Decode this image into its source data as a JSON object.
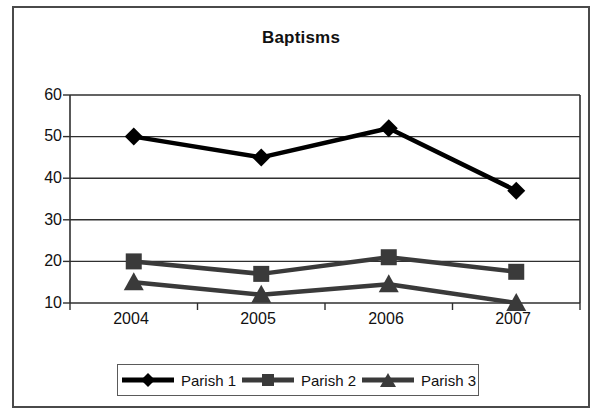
{
  "chart": {
    "title": "Baptisms",
    "legend_position": "bottom"
  },
  "chart_data": {
    "type": "line",
    "title": "Baptisms",
    "xlabel": "",
    "ylabel": "",
    "categories": [
      "2004",
      "2005",
      "2006",
      "2007"
    ],
    "x_tick_labels": [
      "2004",
      "2005",
      "2006",
      "2007"
    ],
    "y_tick_labels": [
      "10",
      "20",
      "30",
      "40",
      "50",
      "60"
    ],
    "y_ticks": [
      10,
      20,
      30,
      40,
      50,
      60
    ],
    "ylim": [
      10,
      60
    ],
    "grid": "horizontal",
    "legend": [
      "Parish 1",
      "Parish 2",
      "Parish 3"
    ],
    "series": [
      {
        "name": "Parish 1",
        "marker": "diamond",
        "color": "#000000",
        "values": [
          50,
          45,
          52,
          37
        ]
      },
      {
        "name": "Parish 2",
        "marker": "square",
        "color": "#3a3a3a",
        "values": [
          20,
          17,
          21,
          17.5
        ]
      },
      {
        "name": "Parish 3",
        "marker": "triangle",
        "color": "#3a3a3a",
        "values": [
          15,
          12,
          14.5,
          10
        ]
      }
    ]
  },
  "axis": {
    "y_labels": [
      "60",
      "50",
      "40",
      "30",
      "20",
      "10"
    ],
    "x_labels": [
      "2004",
      "2005",
      "2006",
      "2007"
    ]
  },
  "legend": {
    "items": [
      {
        "label": "Parish 1",
        "marker": "diamond-marker-icon"
      },
      {
        "label": "Parish 2",
        "marker": "square-marker-icon"
      },
      {
        "label": "Parish 3",
        "marker": "triangle-marker-icon"
      }
    ]
  }
}
